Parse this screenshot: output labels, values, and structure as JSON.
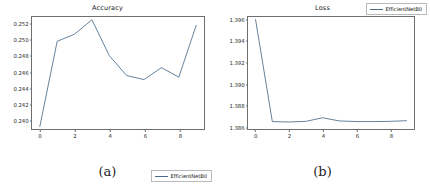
{
  "figure": {
    "panels": [
      {
        "caption": "(a)",
        "legend_label": "EfficientNetB0",
        "legend_position": "lower right",
        "line_color": "#4a6b8a"
      },
      {
        "caption": "(b)",
        "legend_label": "EfficientNetB0",
        "legend_position": "upper right",
        "line_color": "#4a6b8a"
      }
    ]
  },
  "chart_data": [
    {
      "type": "line",
      "title": "Accuracy",
      "xlabel": "",
      "ylabel": "",
      "x": [
        0,
        1,
        2,
        3,
        4,
        5,
        6,
        7,
        8,
        9
      ],
      "series": [
        {
          "name": "EfficientNetB0",
          "values": [
            0.2391,
            0.2498,
            0.2507,
            0.2525,
            0.248,
            0.2455,
            0.245,
            0.2465,
            0.2453,
            0.2518
          ]
        }
      ],
      "xlim": [
        -0.45,
        9.45
      ],
      "ylim": [
        0.2388,
        0.25285
      ],
      "xticks": [
        0,
        2,
        4,
        6,
        8
      ],
      "xticklabels": [
        "0",
        "2",
        "4",
        "6",
        "8"
      ],
      "yticks": [
        0.24,
        0.242,
        0.244,
        0.246,
        0.248,
        0.25,
        0.252
      ],
      "yticklabels": [
        "0.240",
        "0.242",
        "0.244",
        "0.246",
        "0.248",
        "0.250",
        "0.252"
      ],
      "grid": false,
      "legend": [
        "EfficientNetB0"
      ],
      "legend_position": "lower right"
    },
    {
      "type": "line",
      "title": "Loss",
      "xlabel": "",
      "ylabel": "",
      "x": [
        0,
        1,
        2,
        3,
        4,
        5,
        6,
        7,
        8,
        9
      ],
      "series": [
        {
          "name": "EfficientNetB0",
          "values": [
            1.396,
            1.3864,
            1.38636,
            1.38642,
            1.38676,
            1.38646,
            1.3864,
            1.3864,
            1.38642,
            1.38648
          ]
        }
      ],
      "xlim": [
        -0.45,
        9.45
      ],
      "ylim": [
        1.3857,
        1.39625
      ],
      "xticks": [
        0,
        2,
        4,
        6,
        8
      ],
      "xticklabels": [
        "0",
        "2",
        "4",
        "6",
        "8"
      ],
      "yticks": [
        1.386,
        1.388,
        1.39,
        1.392,
        1.394,
        1.396
      ],
      "yticklabels": [
        "1.386",
        "1.388",
        "1.390",
        "1.392",
        "1.394",
        "1.396"
      ],
      "grid": false,
      "legend": [
        "EfficientNetB0"
      ],
      "legend_position": "upper right"
    }
  ]
}
